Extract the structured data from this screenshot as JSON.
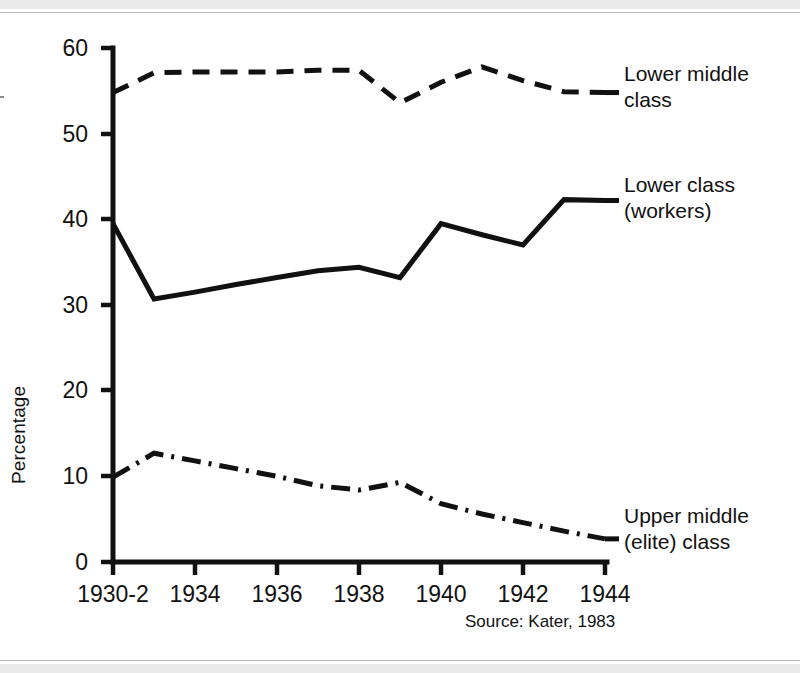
{
  "figure": {
    "caption_source": "Source: Kater, 1983",
    "ylabel": "Percentage",
    "ink_color": "#111111",
    "background": "#ffffff"
  },
  "axes": {
    "y_ticks": [
      "60",
      "50",
      "40",
      "30",
      "20",
      "10",
      "0"
    ],
    "x_ticks": [
      "1930-2",
      "1934",
      "1936",
      "1938",
      "1940",
      "1942",
      "1944"
    ]
  },
  "series_labels": {
    "lower_middle_line1": "Lower middle",
    "lower_middle_line2": "class",
    "lower_line1": "Lower class",
    "lower_line2": "(workers)",
    "upper_middle_line1": "Upper middle",
    "upper_middle_line2": "(elite) class"
  },
  "chart_data": {
    "type": "line",
    "title": "",
    "xlabel": "",
    "ylabel": "Percentage",
    "xlim": [
      1932,
      1944
    ],
    "ylim": [
      0,
      60
    ],
    "grid": false,
    "legend_position": "right-inline-labels",
    "x_tick_labels": [
      "1930-2",
      "1934",
      "1936",
      "1938",
      "1940",
      "1942",
      "1944"
    ],
    "x_tick_values": [
      1932,
      1934,
      1936,
      1938,
      1940,
      1942,
      1944
    ],
    "y_tick_values": [
      0,
      10,
      20,
      30,
      40,
      50,
      60
    ],
    "x": [
      1932,
      1933,
      1934,
      1935,
      1936,
      1937,
      1938,
      1939,
      1940,
      1941,
      1942,
      1943,
      1944
    ],
    "series": [
      {
        "name": "Lower middle class",
        "style": "dashed",
        "color": "#111111",
        "values": [
          54.8,
          57.1,
          57.2,
          57.2,
          57.2,
          57.4,
          57.4,
          53.6,
          56.0,
          57.8,
          56.2,
          54.9,
          54.8
        ]
      },
      {
        "name": "Lower class (workers)",
        "style": "solid",
        "color": "#111111",
        "values": [
          39.5,
          30.7,
          31.5,
          32.4,
          33.2,
          34.0,
          34.4,
          33.2,
          39.5,
          38.2,
          37.0,
          42.3,
          42.2
        ]
      },
      {
        "name": "Upper middle (elite) class",
        "style": "dash-dot",
        "color": "#111111",
        "values": [
          9.9,
          12.7,
          11.8,
          10.9,
          10.0,
          8.9,
          8.4,
          9.3,
          6.8,
          5.6,
          4.6,
          3.6,
          2.7
        ]
      }
    ]
  }
}
